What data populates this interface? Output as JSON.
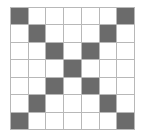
{
  "grid": {
    "rows": 7,
    "cols": 7,
    "fill_color": "#6b6b6b",
    "empty_color": "#ffffff",
    "line_color": "#b8b8b8",
    "cells": [
      [
        1,
        0,
        0,
        0,
        0,
        0,
        1
      ],
      [
        0,
        1,
        0,
        0,
        0,
        1,
        0
      ],
      [
        0,
        0,
        1,
        0,
        1,
        0,
        0
      ],
      [
        0,
        0,
        0,
        1,
        0,
        0,
        0
      ],
      [
        0,
        0,
        1,
        0,
        1,
        0,
        0
      ],
      [
        0,
        1,
        0,
        0,
        0,
        1,
        0
      ],
      [
        1,
        0,
        0,
        0,
        0,
        0,
        1
      ]
    ]
  }
}
